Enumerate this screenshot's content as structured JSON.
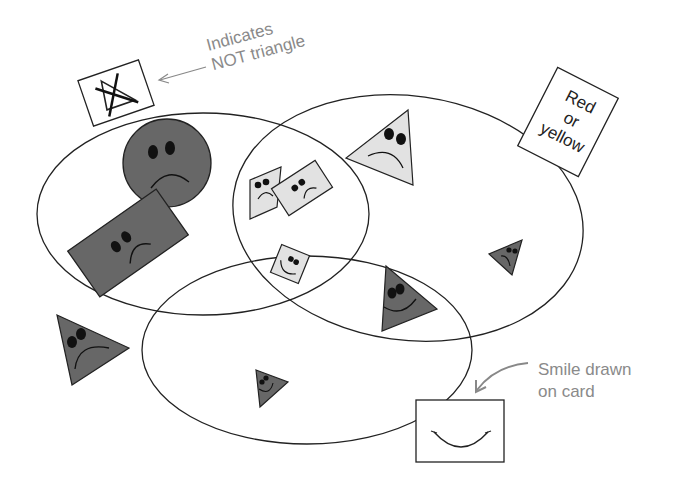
{
  "colors": {
    "background": "#ffffff",
    "outline": "#222222",
    "dark_fill": "#676767",
    "light_fill": "#e2e2e2",
    "annotation": "#8a8a8a"
  },
  "annotations": {
    "not_triangle": {
      "line1": "Indicates",
      "line2": "NOT triangle"
    },
    "smile_card": {
      "line1": "Smile drawn",
      "line2": "on card"
    }
  },
  "cards": {
    "red_or_yellow": {
      "line1": "Red",
      "line2": "or",
      "line3": "yellow"
    }
  },
  "sets": [
    {
      "id": "left",
      "meaning": "NOT triangle"
    },
    {
      "id": "right",
      "meaning": "Red or yellow"
    },
    {
      "id": "bottom",
      "meaning": "Smile drawn on card"
    }
  ],
  "shapes": [
    {
      "shape": "circle",
      "shade": "dark",
      "face": "frown",
      "region": "left only"
    },
    {
      "shape": "rectangle",
      "shade": "dark",
      "face": "frown",
      "region": "left only"
    },
    {
      "shape": "parallelogram",
      "shade": "light",
      "face": "frown",
      "region": "left and right"
    },
    {
      "shape": "rectangle",
      "shade": "light",
      "face": "frown",
      "region": "left and right"
    },
    {
      "shape": "square",
      "shade": "light",
      "face": "smile",
      "region": "left, right and bottom"
    },
    {
      "shape": "triangle",
      "shade": "light",
      "face": "frown",
      "region": "right only"
    },
    {
      "shape": "triangle",
      "shade": "dark",
      "face": "frown",
      "region": "right only"
    },
    {
      "shape": "triangle",
      "shade": "dark",
      "face": "smile",
      "region": "right and bottom"
    },
    {
      "shape": "triangle",
      "shade": "dark",
      "face": "smile",
      "region": "bottom only"
    },
    {
      "shape": "triangle",
      "shade": "dark",
      "face": "frown",
      "region": "outside"
    }
  ]
}
